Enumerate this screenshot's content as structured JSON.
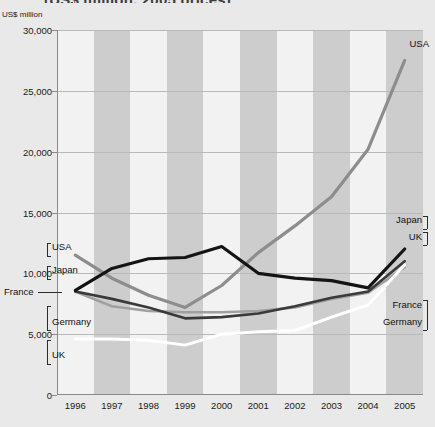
{
  "title": "(US$ million, 2005 prices)",
  "axis_unit": "US$ million",
  "colors": {
    "japan": "#141414",
    "france": "#3a3a3a",
    "usa": "#8d8d8d",
    "germany": "#a0a0a0",
    "uk": "#ffffff",
    "band": "#cdcdcd",
    "plot_bg": "#f2f2f2",
    "page_bg": "#e9e9e9",
    "grid": "#b9b9b9"
  },
  "labels_left": [
    {
      "name": "USA",
      "text": "USA"
    },
    {
      "name": "Japan",
      "text": "Japan"
    },
    {
      "name": "France",
      "text": "France"
    },
    {
      "name": "Germany",
      "text": "Germany"
    },
    {
      "name": "UK",
      "text": "UK"
    }
  ],
  "labels_right": [
    {
      "name": "USA",
      "text": "USA"
    },
    {
      "name": "Japan",
      "text": "Japan"
    },
    {
      "name": "UK",
      "text": "UK"
    },
    {
      "name": "France",
      "text": "France"
    },
    {
      "name": "Germany",
      "text": "Germany"
    }
  ],
  "chart_data": {
    "type": "line",
    "title": "(US$ million, 2005 prices)",
    "xlabel": "",
    "ylabel": "US$ million",
    "ylim": [
      0,
      30000
    ],
    "yticks": [
      0,
      5000,
      10000,
      15000,
      20000,
      25000,
      30000
    ],
    "ytick_labels": [
      "0",
      "5,000",
      "10,000",
      "15,000",
      "20,000",
      "25,000",
      "30,000"
    ],
    "grid": true,
    "legend_position": "inline-endpoint-callouts",
    "categories": [
      "1996",
      "1997",
      "1998",
      "1999",
      "2000",
      "2001",
      "2002",
      "2003",
      "2004",
      "2005"
    ],
    "series": [
      {
        "name": "USA",
        "color": "#8d8d8d",
        "values": [
          11500,
          9600,
          8200,
          7200,
          9000,
          11700,
          13900,
          16300,
          20200,
          27500
        ]
      },
      {
        "name": "Japan",
        "color": "#141414",
        "values": [
          8600,
          10400,
          11200,
          11300,
          12200,
          10000,
          9600,
          9400,
          8800,
          12000
        ]
      },
      {
        "name": "France",
        "color": "#3a3a3a",
        "values": [
          8500,
          7900,
          7200,
          6300,
          6400,
          6700,
          7300,
          8000,
          8500,
          11000
        ]
      },
      {
        "name": "Germany",
        "color": "#a0a0a0",
        "values": [
          8500,
          7300,
          6900,
          6800,
          6800,
          6900,
          7200,
          7900,
          8400,
          10500
        ]
      },
      {
        "name": "UK",
        "color": "#ffffff",
        "values": [
          4600,
          4600,
          4500,
          4100,
          5000,
          5200,
          5300,
          6400,
          7400,
          10700
        ]
      }
    ]
  }
}
